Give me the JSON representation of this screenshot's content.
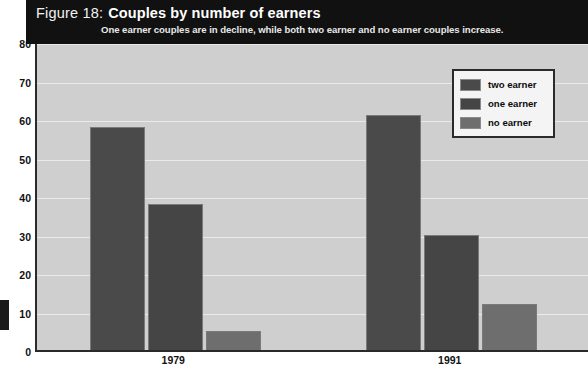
{
  "figure": {
    "number": "Figure 18:",
    "title": "Couples by number of earners",
    "subtitle": "One earner couples are in decline, while both two earner and no earner couples increase."
  },
  "legend": {
    "position": "top-right",
    "items": [
      {
        "label": "two earner",
        "color": "#4a4a4a"
      },
      {
        "label": "one earner",
        "color": "#454545"
      },
      {
        "label": "no earner",
        "color": "#6e6e6e"
      }
    ]
  },
  "axes": {
    "y_title": "Percentage of couples of working age",
    "y_ticks": [
      "0",
      "10",
      "20",
      "30",
      "40",
      "50",
      "60",
      "70",
      "80"
    ],
    "x_ticks": [
      "1979",
      "1991"
    ]
  },
  "chart_data": {
    "type": "bar",
    "title": "Couples by number of earners",
    "subtitle": "One earner couples are in decline, while both two earner and no earner couples increase.",
    "categories": [
      "1979",
      "1991"
    ],
    "series": [
      {
        "name": "two earner",
        "values": [
          58,
          61
        ],
        "color": "#4a4a4a"
      },
      {
        "name": "one earner",
        "values": [
          38,
          30
        ],
        "color": "#454545"
      },
      {
        "name": "no earner",
        "values": [
          5,
          12
        ],
        "color": "#6e6e6e"
      }
    ],
    "xlabel": "",
    "ylabel": "Percentage of couples of working age",
    "ylim": [
      0,
      80
    ],
    "ytick_step": 10,
    "grid": true,
    "legend_position": "top-right"
  }
}
